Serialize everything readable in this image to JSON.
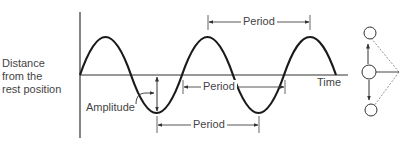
{
  "diagram": {
    "y_axis_label_lines": [
      "Distance",
      "from the",
      "rest position"
    ],
    "x_axis_label": "Time",
    "amplitude_label": "Amplitude",
    "period_labels": [
      "Period",
      "Period",
      "Period"
    ],
    "wave": {
      "type": "sine",
      "cycles_shown": 2.5,
      "stroke_color": "#1a1a1a"
    },
    "pendulum": {
      "positions": [
        "top",
        "rest",
        "bottom"
      ],
      "arrows": [
        "up",
        "down"
      ]
    }
  }
}
